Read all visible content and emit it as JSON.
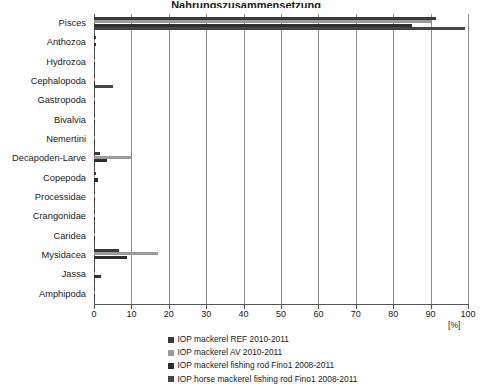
{
  "title": {
    "text": "Nahrungszusammensetzung",
    "clipped": true
  },
  "axis": {
    "x_unit_label": "[%]",
    "x_ticks": [
      0,
      10,
      20,
      30,
      40,
      50,
      60,
      70,
      80,
      90,
      100
    ],
    "x_tick_labels": [
      "0",
      "10",
      "20",
      "30",
      "40",
      "50",
      "60",
      "70",
      "80",
      "90",
      "100"
    ]
  },
  "legend": {
    "position": "bottom",
    "items": [
      {
        "label": "IOP mackerel REF 2010-2011",
        "color": "#3a3a3a"
      },
      {
        "label": "IOP mackerel AV 2010-2011",
        "color": "#9b9b9b"
      },
      {
        "label": "IOP mackerel fishing rod Fino1 2008-2011",
        "color": "#2e2e2e"
      },
      {
        "label": "IOP horse mackerel fishing rod Fino1 2008-2011",
        "color": "#444444"
      }
    ]
  },
  "chart_data": {
    "type": "bar",
    "orientation": "horizontal",
    "title": "Nahrungszusammensetzung",
    "xlabel": "[%]",
    "ylabel": "",
    "xlim": [
      0,
      100
    ],
    "grid": true,
    "legend_position": "bottom",
    "categories": [
      "Pisces",
      "Anthozoa",
      "Hydrozoa",
      "Cephalopoda",
      "Gastropoda",
      "Bivalvia",
      "Nemertini",
      "Decapoden-Larve",
      "Copepoda",
      "Processidae",
      "Crangonidae",
      "Caridea",
      "Mysidacea",
      "Jassa",
      "Amphipoda"
    ],
    "series": [
      {
        "name": "IOP mackerel REF 2010-2011",
        "color": "#3a3a3a",
        "values": [
          91.5,
          0.6,
          0.4,
          0.4,
          0.3,
          0.3,
          0.3,
          1.6,
          0.6,
          0.3,
          0.3,
          0.4,
          6.8,
          0.4,
          0.4
        ]
      },
      {
        "name": "IOP mackerel AV 2010-2011",
        "color": "#9b9b9b",
        "values": [
          90.0,
          0.4,
          0.4,
          0.4,
          0.3,
          0.3,
          0.4,
          10.2,
          0.4,
          0.3,
          0.3,
          0.4,
          17.0,
          0.4,
          0.4
        ]
      },
      {
        "name": "IOP mackerel fishing rod Fino1 2008-2011",
        "color": "#2e2e2e",
        "values": [
          85.0,
          0.5,
          0.4,
          0.4,
          0.4,
          0.4,
          0.4,
          3.6,
          1.2,
          0.4,
          0.4,
          0.4,
          8.8,
          1.8,
          0.4
        ]
      },
      {
        "name": "IOP horse mackerel fishing rod Fino1 2008-2011",
        "color": "#444444",
        "values": [
          99.2,
          0.4,
          0.4,
          5.2,
          0.4,
          0.4,
          0.4,
          0.4,
          0.4,
          0.4,
          0.4,
          0.4,
          0.4,
          0.4,
          0.4
        ]
      }
    ]
  }
}
